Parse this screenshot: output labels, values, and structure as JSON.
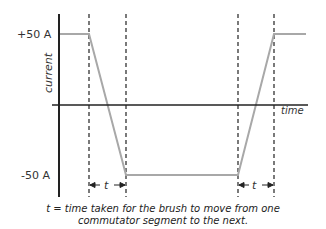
{
  "diagram": {
    "y_axis_label": "current",
    "x_axis_label": "time",
    "y_tick_top": "+50 A",
    "y_tick_bottom": "-50 A",
    "interval_label_left": "t",
    "interval_label_right": "t",
    "caption_line1": "t = time taken for the brush to move from one",
    "caption_line2": "commutator segment to the next.",
    "colors": {
      "axis": "#222222",
      "waveform": "#a8a8a8",
      "dashed": "#222222",
      "text": "#333333"
    }
  }
}
